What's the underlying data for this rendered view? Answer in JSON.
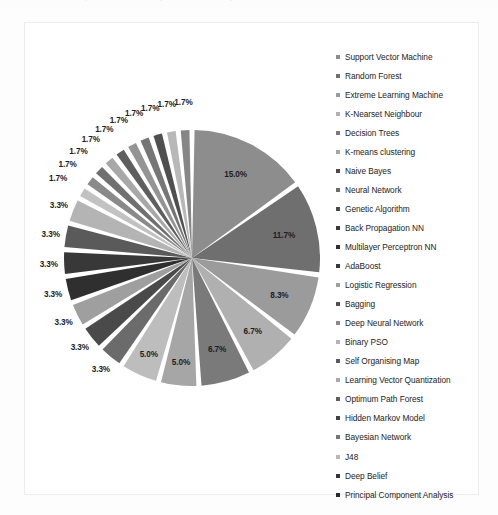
{
  "page": {
    "background_color": "#fdfdfd",
    "frame_border_color": "#ececec",
    "cropped_top_text": ""
  },
  "chart_data": {
    "type": "pie",
    "title": "",
    "subtitle": "",
    "xlabel": "",
    "ylabel": "",
    "grid": false,
    "legend_position": "right",
    "label_format": "percent",
    "total_percent": 100.0,
    "categories": [
      "Support Vector Machine",
      "Random Forest",
      "Extreme Learning Machine",
      "K-Nearset Neighbour",
      "Decision Trees",
      "K-means clustering",
      "Naive Bayes",
      "Neural Network",
      "Genetic Algorithm",
      "Back Propagation NN",
      "Multilayer Perceptron NN",
      "AdaBoost",
      "Logistic Regression",
      "Bagging",
      "Deep Neural Network",
      "Binary PSO",
      "Self Organising Map",
      "Learning Vector Quantization",
      "Optimum Path Forest",
      "Hidden Markov Model",
      "Bayesian Network",
      "J48",
      "Deep Belief",
      "Principal Component Analysis"
    ],
    "values": [
      15.0,
      11.7,
      8.3,
      6.7,
      6.7,
      5.0,
      5.0,
      3.3,
      3.3,
      3.3,
      3.3,
      3.3,
      3.3,
      3.3,
      1.7,
      1.7,
      1.7,
      1.7,
      1.7,
      1.7,
      1.7,
      1.7,
      1.7,
      1.7
    ],
    "value_labels": [
      "15.0%",
      "11.7%",
      "8.3%",
      "6.7%",
      "6.7%",
      "5.0%",
      "5.0%",
      "3.3%",
      "3.3%",
      "3.3%",
      "3.3%",
      "3.3%",
      "3.3%",
      "3.3%",
      "1.7%",
      "1.7%",
      "1.7%",
      "1.7%",
      "1.7%",
      "1.7%",
      "1.7%",
      "1.7%",
      "1.7%",
      "1.7%"
    ],
    "colors": [
      "#8d8d8d",
      "#6f6f6f",
      "#9b9b9b",
      "#b0b0b0",
      "#7a7a7a",
      "#a6a6a6",
      "#bdbdbd",
      "#6b6b6b",
      "#4a4a4a",
      "#9f9f9f",
      "#2f2f2f",
      "#383838",
      "#5a5a5a",
      "#b4b4b4",
      "#c2c2c2",
      "#8a8a8a",
      "#707070",
      "#a8a8a8",
      "#5e5e5e",
      "#949494",
      "#767676",
      "#4f4f4f",
      "#b8b8b8",
      "#868686"
    ]
  },
  "legend": {
    "items": [
      {
        "label": "Support Vector Machine",
        "color": "#8d8d8d"
      },
      {
        "label": "Random Forest",
        "color": "#6f6f6f"
      },
      {
        "label": "Extreme Learning Machine",
        "color": "#9b9b9b"
      },
      {
        "label": "K-Nearset Neighbour",
        "color": "#b0b0b0"
      },
      {
        "label": "Decision Trees",
        "color": "#7a7a7a"
      },
      {
        "label": "K-means clustering",
        "color": "#a6a6a6"
      },
      {
        "label": "Naive Bayes",
        "color": "#4a4a4a"
      },
      {
        "label": "Neural Network",
        "color": "#6b6b6b"
      },
      {
        "label": "Genetic Algorithm",
        "color": "#4a4a4a"
      },
      {
        "label": "Back Propagation NN",
        "color": "#3a3a3a"
      },
      {
        "label": "Multilayer Perceptron NN",
        "color": "#2f2f2f"
      },
      {
        "label": "AdaBoost",
        "color": "#383838"
      },
      {
        "label": "Logistic Regression",
        "color": "#9f9f9f"
      },
      {
        "label": "Bagging",
        "color": "#4f4f4f"
      },
      {
        "label": "Deep Neural Network",
        "color": "#8a8a8a"
      },
      {
        "label": "Binary PSO",
        "color": "#b4b4b4"
      },
      {
        "label": "Self Organising Map",
        "color": "#5a5a5a"
      },
      {
        "label": "Learning Vector Quantization",
        "color": "#a8a8a8"
      },
      {
        "label": "Optimum Path Forest",
        "color": "#5e5e5e"
      },
      {
        "label": "Hidden Markov Model",
        "color": "#424242"
      },
      {
        "label": "Bayesian Network",
        "color": "#767676"
      },
      {
        "label": "J48",
        "color": "#b8b8b8"
      },
      {
        "label": "Deep Belief",
        "color": "#333333"
      },
      {
        "label": "Principal Component Analysis",
        "color": "#2b2b2b"
      }
    ]
  }
}
